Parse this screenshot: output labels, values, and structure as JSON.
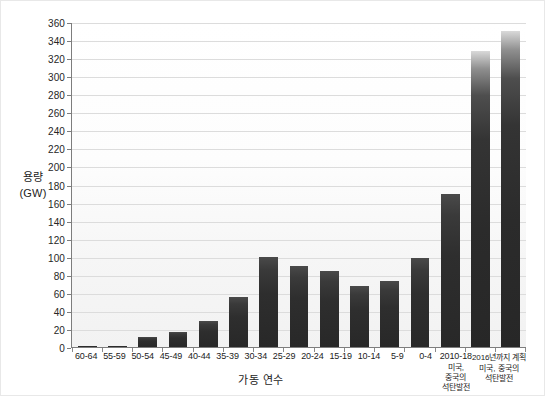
{
  "chart_data": {
    "type": "bar",
    "title": "",
    "xlabel": "가동 연수",
    "ylabel": "용량\n(GW)",
    "ylabel_line1": "용량",
    "ylabel_line2": "(GW)",
    "ylim": [
      0,
      360
    ],
    "ytick_step": 20,
    "yticks": [
      0,
      20,
      40,
      60,
      80,
      100,
      120,
      140,
      160,
      180,
      200,
      220,
      240,
      260,
      280,
      300,
      320,
      340,
      360
    ],
    "grid": true,
    "legend": null,
    "categories": [
      "60-64",
      "55-59",
      "50-54",
      "45-49",
      "40-44",
      "35-39",
      "30-34",
      "25-29",
      "20-24",
      "15-19",
      "10-14",
      "5-9",
      "0-4",
      "2010-18",
      "2016년까지 계획"
    ],
    "category_sublabels": [
      "",
      "",
      "",
      "",
      "",
      "",
      "",
      "",
      "",
      "",
      "",
      "",
      "",
      "미국,\n중국의\n석탄발전",
      "미국, 중국의\n석탄발전"
    ],
    "values": [
      1,
      1,
      11,
      17,
      29,
      55,
      100,
      90,
      84,
      68,
      73,
      99,
      169,
      328,
      350
    ],
    "bar_color": "#2e2e2e",
    "grid_color": "#dcdcdc",
    "axis_color": "#7d7d7d",
    "text_color": "#1c1c1c"
  }
}
